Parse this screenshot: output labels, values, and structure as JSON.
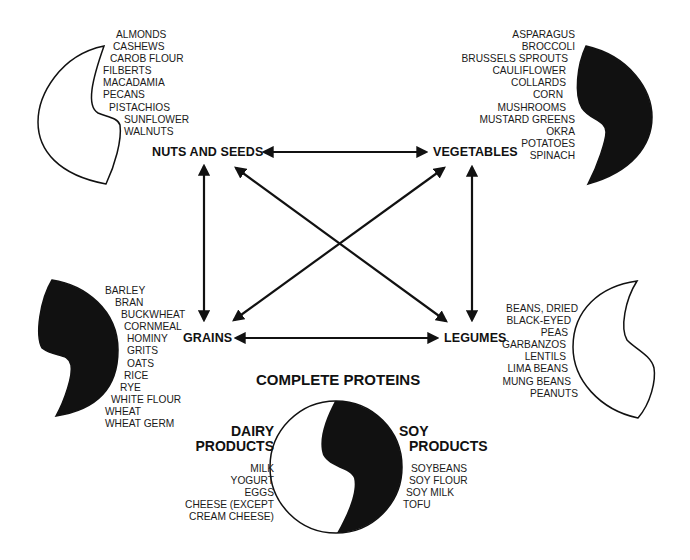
{
  "diagram": {
    "title": "COMPLETE PROTEINS",
    "groups": {
      "nuts_seeds": {
        "label": "NUTS AND SEEDS",
        "items": [
          "ALMONDS",
          "CASHEWS",
          "CAROB FLOUR",
          "FILBERTS",
          "MACADAMIA",
          "PECANS",
          "PISTACHIOS",
          "SUNFLOWER",
          "WALNUTS"
        ]
      },
      "vegetables": {
        "label": "VEGETABLES",
        "items": [
          "ASPARAGUS",
          "BROCCOLI",
          "BRUSSELS SPROUTS",
          "CAULIFLOWER",
          "COLLARDS",
          "CORN",
          "MUSHROOMS",
          "MUSTARD GREENS",
          "OKRA",
          "POTATOES",
          "SPINACH"
        ]
      },
      "grains": {
        "label": "GRAINS",
        "items": [
          "BARLEY",
          "BRAN",
          "BUCKWHEAT",
          "CORNMEAL",
          "HOMINY",
          "GRITS",
          "OATS",
          "RICE",
          "RYE",
          "WHITE FLOUR",
          "WHEAT",
          "WHEAT GERM"
        ]
      },
      "legumes": {
        "label": "LEGUMES",
        "items": [
          "BEANS, DRIED",
          "BLACK-EYED",
          "PEAS",
          "GARBANZOS",
          "LENTILS",
          "LIMA BEANS",
          "MUNG BEANS",
          "PEANUTS"
        ]
      },
      "dairy": {
        "label_line1": "DAIRY",
        "label_line2": "PRODUCTS",
        "items": [
          "MILK",
          "YOGURT",
          "EGGS",
          "CHEESE (EXCEPT",
          "CREAM CHEESE)"
        ]
      },
      "soy": {
        "label_line1": "SOY",
        "label_line2": "PRODUCTS",
        "items": [
          "SOYBEANS",
          "SOY FLOUR",
          "SOY MILK",
          "TOFU"
        ]
      }
    },
    "connections": [
      {
        "from": "NUTS AND SEEDS",
        "to": "VEGETABLES",
        "type": "double-arrow"
      },
      {
        "from": "NUTS AND SEEDS",
        "to": "GRAINS",
        "type": "double-arrow"
      },
      {
        "from": "NUTS AND SEEDS",
        "to": "LEGUMES",
        "type": "double-arrow"
      },
      {
        "from": "VEGETABLES",
        "to": "GRAINS",
        "type": "double-arrow"
      },
      {
        "from": "VEGETABLES",
        "to": "LEGUMES",
        "type": "double-arrow"
      },
      {
        "from": "GRAINS",
        "to": "LEGUMES",
        "type": "double-arrow"
      }
    ],
    "colors": {
      "ink": "#111111",
      "background": "#ffffff"
    }
  }
}
